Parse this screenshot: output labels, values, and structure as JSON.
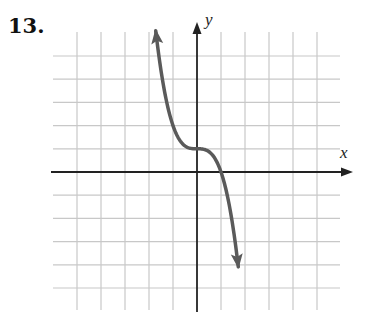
{
  "problem_number": "13.",
  "chart_data": {
    "type": "line",
    "title": "",
    "xlabel": "x",
    "ylabel": "y",
    "xlim": [
      -6,
      6
    ],
    "ylim": [
      -6,
      6
    ],
    "grid": true,
    "grid_spacing": 1,
    "tick_labels": false,
    "series": [
      {
        "name": "f(x)",
        "description": "Decreasing cubic with flat inflection at (0, 1), crossing x-axis at x = 1; arrows at both ends",
        "equation": "y = 1 - x^3",
        "x": [
          -1.8,
          -1.5,
          -1.0,
          -0.5,
          0,
          0.5,
          1.0,
          1.5,
          1.8
        ],
        "values": [
          6.8,
          4.4,
          2.0,
          1.1,
          1.0,
          0.9,
          0.0,
          -2.4,
          -4.8
        ]
      }
    ],
    "colors": {
      "curve": "#5a5a5a",
      "grid": "#c8c8c8",
      "axes": "#222222"
    }
  }
}
